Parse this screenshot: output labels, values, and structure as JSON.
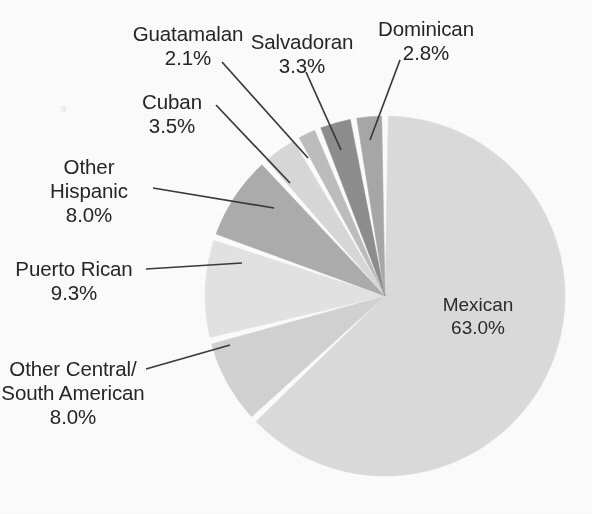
{
  "figure": {
    "background_color": "#fdfdfd",
    "text_color": "#262626",
    "separator_color": "#ffffff",
    "leader_line_color": "#3a3a3a"
  },
  "chart_data": {
    "type": "pie",
    "title": "",
    "subtitle": "",
    "xlabel": "",
    "ylabel": "",
    "legend_position": "none",
    "grid": false,
    "units": "percent",
    "start_angle_deg": 0,
    "direction": "clockwise",
    "center": {
      "x": 385,
      "y": 296
    },
    "radius": 180,
    "total": 100.0,
    "categories": [
      "Mexican",
      "Other Central/ South American",
      "Puerto Rican",
      "Other Hispanic",
      "Cuban",
      "Guatamalan",
      "Salvadoran",
      "Dominican"
    ],
    "values": [
      63.0,
      8.0,
      9.3,
      8.0,
      3.5,
      2.1,
      3.3,
      2.8
    ],
    "colors": [
      "#dcdcdc",
      "#d3d3d3",
      "#e4e4e4",
      "#adadad",
      "#d9d9d9",
      "#bebebe",
      "#8e8e8e",
      "#a8a8a8"
    ],
    "slices": [
      {
        "label": "Mexican",
        "value": 63.0,
        "value_text": "63.0%",
        "color": "#dcdcdc",
        "label_placement": "inside"
      },
      {
        "label": "Other Central/ South American",
        "value": 8.0,
        "value_text": "8.0%",
        "color": "#d3d3d3",
        "label_placement": "outside"
      },
      {
        "label": "Puerto Rican",
        "value": 9.3,
        "value_text": "9.3%",
        "color": "#e4e4e4",
        "label_placement": "outside"
      },
      {
        "label": "Other Hispanic",
        "value": 8.0,
        "value_text": "8.0%",
        "color": "#adadad",
        "label_placement": "outside"
      },
      {
        "label": "Cuban",
        "value": 3.5,
        "value_text": "3.5%",
        "color": "#d9d9d9",
        "label_placement": "outside"
      },
      {
        "label": "Guatamalan",
        "value": 2.1,
        "value_text": "2.1%",
        "color": "#bebebe",
        "label_placement": "outside"
      },
      {
        "label": "Salvadoran",
        "value": 3.3,
        "value_text": "3.3%",
        "color": "#8e8e8e",
        "label_placement": "outside"
      },
      {
        "label": "Dominican",
        "value": 2.8,
        "value_text": "2.8%",
        "color": "#a8a8a8",
        "label_placement": "outside"
      }
    ]
  },
  "labels": {
    "guatamalan": {
      "name": "Guatamalan",
      "pct": "2.1%"
    },
    "salvadoran": {
      "name": "Salvadoran",
      "pct": "3.3%"
    },
    "dominican": {
      "name": "Dominican",
      "pct": "2.8%"
    },
    "cuban": {
      "name": "Cuban",
      "pct": "3.5%"
    },
    "other_hispanic": {
      "name_line1": "Other",
      "name_line2": "Hispanic",
      "pct": "8.0%"
    },
    "puerto_rican": {
      "name": "Puerto Rican",
      "pct": "9.3%"
    },
    "other_central_south": {
      "name_line1": "Other Central/",
      "name_line2": "South American",
      "pct": "8.0%"
    },
    "mexican": {
      "name": "Mexican",
      "pct": "63.0%"
    }
  }
}
